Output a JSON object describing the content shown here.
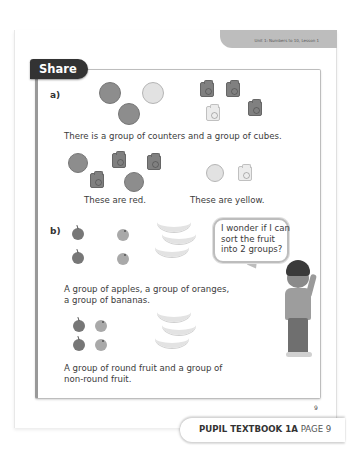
{
  "header": {
    "unit_label": "Unit 1: Numbers to 10, Lesson 1"
  },
  "section": {
    "title": "Share"
  },
  "part_a": {
    "label": "a)",
    "sentence": "There is a group of counters and a group of cubes.",
    "counters": [
      "red",
      "yellow",
      "red"
    ],
    "cubes": [
      "red",
      "red",
      "yellow",
      "red"
    ],
    "red_group_caption": "These are red.",
    "yellow_group_caption": "These are yellow."
  },
  "part_b": {
    "label": "b)",
    "fruit": {
      "apples": 2,
      "oranges": 2,
      "bananas": 3
    },
    "sentence_lines": [
      "A group of apples, a group of oranges,",
      "a group of bananas."
    ],
    "round_fruit": {
      "apples": 2,
      "oranges": 2
    },
    "non_round_fruit": {
      "bananas": 3
    },
    "conclusion_lines": [
      "A group of round fruit and a group of",
      "non-round fruit."
    ]
  },
  "speech_bubble": {
    "lines": [
      "I wonder if I can",
      "sort the fruit",
      "into 2 groups?"
    ]
  },
  "page_number": "9",
  "footer": {
    "book": "PUPIL TEXTBOOK 1A",
    "page": "PAGE 9"
  }
}
